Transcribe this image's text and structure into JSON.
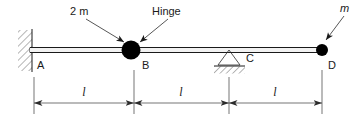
{
  "figure": {
    "type": "statics-beam-diagram",
    "width": 359,
    "height": 121,
    "background_color": "#ffffff",
    "line_color": "#1a1a1a"
  },
  "callouts": {
    "mass_left": "2 m",
    "hinge": "Hinge",
    "mass_right": "m"
  },
  "nodes": [
    {
      "id": "A",
      "label": "A",
      "x": 30,
      "support": "fixed-wall"
    },
    {
      "id": "B",
      "label": "B",
      "x": 131,
      "support": "hinge-with-mass"
    },
    {
      "id": "C",
      "label": "C",
      "x": 229,
      "support": "pin-triangle"
    },
    {
      "id": "D",
      "label": "D",
      "x": 322,
      "support": "free-end-with-mass"
    }
  ],
  "dimensions": [
    {
      "label": "l",
      "from": "A",
      "to": "B"
    },
    {
      "label": "l",
      "from": "B",
      "to": "C"
    },
    {
      "label": "l",
      "from": "C",
      "to": "D"
    }
  ]
}
